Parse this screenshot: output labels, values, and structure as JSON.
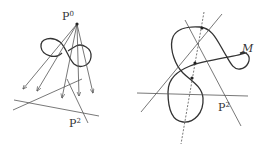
{
  "left_panel": {
    "point_label": "P",
    "point_sup": "0",
    "plane_label": "P",
    "plane_sup": "2"
  },
  "right_panel": {
    "curve_label": "M",
    "plane_label": "P",
    "plane_sup": "2"
  },
  "colors": {
    "stroke": "#444444",
    "curve": "#333333",
    "text": "#333333"
  }
}
